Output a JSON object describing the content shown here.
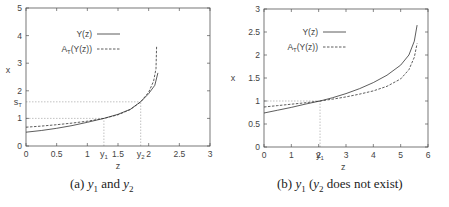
{
  "chart_data": [
    {
      "type": "line",
      "panel": "a",
      "caption": {
        "prefix": "(a)",
        "text_parts": [
          "y",
          "1",
          " and ",
          "y",
          "2"
        ]
      },
      "xlabel": "z",
      "ylabel": "x",
      "xlim": [
        0,
        3
      ],
      "ylim": [
        0,
        5
      ],
      "x_ticks": [
        "0",
        "0.5",
        "1",
        "1.5",
        "2",
        "2.5",
        "3"
      ],
      "y_ticks": [
        "0",
        "1",
        "2",
        "3",
        "4",
        "5"
      ],
      "extra_x_labels": [
        {
          "label": "y1",
          "value": 1.27
        },
        {
          "label": "y2",
          "value": 1.87
        }
      ],
      "extra_y_labels": [
        {
          "label": "sT",
          "value": 1.6
        }
      ],
      "legend": [
        "Y(z)",
        "AT(Y(z))"
      ],
      "legend_position": "upper-left",
      "series": [
        {
          "name": "Y(z)",
          "style": "solid",
          "points": [
            [
              0,
              0.5
            ],
            [
              0.25,
              0.56
            ],
            [
              0.5,
              0.64
            ],
            [
              0.75,
              0.74
            ],
            [
              1.0,
              0.86
            ],
            [
              1.27,
              1.0
            ],
            [
              1.5,
              1.15
            ],
            [
              1.7,
              1.33
            ],
            [
              1.87,
              1.6
            ],
            [
              2.0,
              1.9
            ],
            [
              2.1,
              2.2
            ],
            [
              2.15,
              2.65
            ]
          ]
        },
        {
          "name": "AT(Y(z))",
          "style": "dashed",
          "points": [
            [
              0,
              0.68
            ],
            [
              0.25,
              0.72
            ],
            [
              0.5,
              0.77
            ],
            [
              0.75,
              0.83
            ],
            [
              1.0,
              0.9
            ],
            [
              1.27,
              1.0
            ],
            [
              1.5,
              1.13
            ],
            [
              1.7,
              1.32
            ],
            [
              1.87,
              1.6
            ],
            [
              2.0,
              1.95
            ],
            [
              2.08,
              2.35
            ],
            [
              2.12,
              2.8
            ],
            [
              2.13,
              3.6
            ]
          ]
        }
      ],
      "guides": [
        {
          "type": "h",
          "y": 1.0,
          "x_to": 1.27
        },
        {
          "type": "v",
          "x": 1.27,
          "y_to": 1.0
        },
        {
          "type": "h",
          "y": 1.6,
          "x_to": 1.87
        },
        {
          "type": "v",
          "x": 1.87,
          "y_to": 1.6
        }
      ],
      "grid": false
    },
    {
      "type": "line",
      "panel": "b",
      "caption": {
        "prefix": "(b)",
        "text_parts": [
          "y",
          "1",
          " (",
          "y",
          "2",
          " does not exist)"
        ]
      },
      "xlabel": "z",
      "ylabel": "x",
      "xlim": [
        0,
        6
      ],
      "ylim": [
        0,
        3
      ],
      "x_ticks": [
        "0",
        "1",
        "2",
        "3",
        "4",
        "5",
        "6"
      ],
      "y_ticks": [
        "0",
        "0.5",
        "1",
        "1.5",
        "2",
        "2.5",
        "3"
      ],
      "extra_x_labels": [
        {
          "label": "y1",
          "value": 2.05
        }
      ],
      "legend": [
        "Y(z)",
        "AT(Y(z))"
      ],
      "legend_position": "upper-left",
      "series": [
        {
          "name": "Y(z)",
          "style": "solid",
          "points": [
            [
              0,
              0.74
            ],
            [
              0.5,
              0.8
            ],
            [
              1,
              0.86
            ],
            [
              1.5,
              0.93
            ],
            [
              2.05,
              1.0
            ],
            [
              2.5,
              1.07
            ],
            [
              3,
              1.16
            ],
            [
              3.5,
              1.27
            ],
            [
              4,
              1.4
            ],
            [
              4.5,
              1.56
            ],
            [
              5,
              1.78
            ],
            [
              5.3,
              2.0
            ],
            [
              5.5,
              2.3
            ],
            [
              5.6,
              2.65
            ]
          ]
        },
        {
          "name": "AT(Y(z))",
          "style": "dashed",
          "points": [
            [
              0,
              0.87
            ],
            [
              0.5,
              0.9
            ],
            [
              1,
              0.93
            ],
            [
              1.5,
              0.96
            ],
            [
              2.05,
              1.0
            ],
            [
              2.5,
              1.04
            ],
            [
              3,
              1.09
            ],
            [
              3.5,
              1.15
            ],
            [
              4,
              1.22
            ],
            [
              4.5,
              1.32
            ],
            [
              5,
              1.48
            ],
            [
              5.3,
              1.68
            ],
            [
              5.5,
              1.95
            ],
            [
              5.6,
              2.25
            ]
          ]
        }
      ],
      "guides": [
        {
          "type": "h",
          "y": 1.0,
          "x_to": 2.05
        },
        {
          "type": "v",
          "x": 2.05,
          "y_to": 1.0
        }
      ],
      "grid": false
    }
  ]
}
